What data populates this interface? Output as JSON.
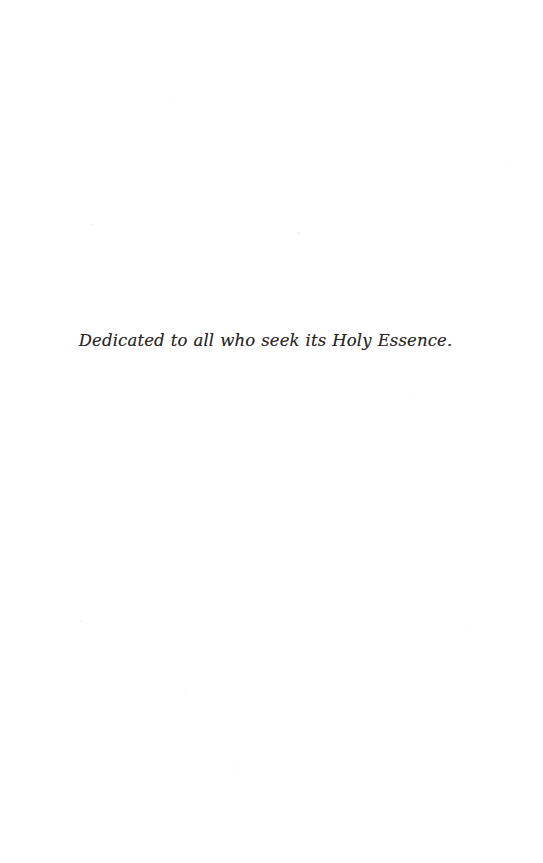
{
  "page": {
    "kind": "book-dedication-page",
    "background_color": "#ffffff",
    "ink_color": "#2b2624",
    "width_px": 543,
    "height_px": 863
  },
  "dedication": {
    "text": "Dedicated to all who seek its Holy Essence."
  }
}
